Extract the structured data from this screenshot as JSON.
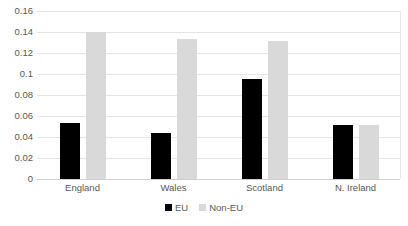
{
  "chart_data": {
    "type": "bar",
    "title": "",
    "subtitle": "",
    "xlabel": "",
    "ylabel": "",
    "categories": [
      "England",
      "Wales",
      "Scotland",
      "N. Ireland"
    ],
    "series": [
      {
        "name": "EU",
        "color": "#000000",
        "values": [
          0.053,
          0.044,
          0.095,
          0.051
        ]
      },
      {
        "name": "Non-EU",
        "color": "#d9d9d9",
        "values": [
          0.14,
          0.133,
          0.131,
          0.051
        ]
      }
    ],
    "ylim": [
      0,
      0.16
    ],
    "ytick_step": 0.02,
    "ytick_labels": [
      "0.16",
      "0.14",
      "0.12",
      "0.1",
      "0.08",
      "0.06",
      "0.04",
      "0.02",
      "0"
    ],
    "ytick_values": [
      0.16,
      0.14,
      0.12,
      0.1,
      0.08,
      0.06,
      0.04,
      0.02,
      0
    ],
    "grid": true,
    "grid_axis": "y",
    "legend": true,
    "legend_position": "bottom",
    "legend_entries": [
      "EU",
      "Non-EU"
    ]
  }
}
